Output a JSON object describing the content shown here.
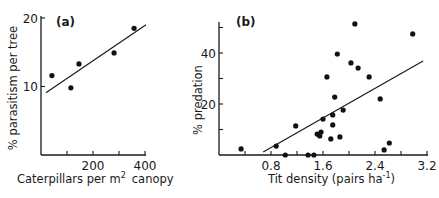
{
  "chart_data": [
    {
      "type": "scatter",
      "panel_label": "(a)",
      "xlabel": "Caterpillars per m",
      "xlabel_superscript": "2",
      "xlabel_suffix": "canopy",
      "ylabel": "% parasitism per tree",
      "xlim": [
        0,
        400
      ],
      "ylim": [
        0,
        20
      ],
      "xticks": [
        100,
        200,
        300,
        400
      ],
      "xtick_labels": [
        {
          "value": 200,
          "label": "200"
        },
        {
          "value": 400,
          "label": "400"
        }
      ],
      "yticks": [
        10,
        20
      ],
      "ytick_labels": [
        {
          "value": 10,
          "label": "10"
        },
        {
          "value": 20,
          "label": "20"
        }
      ],
      "points": [
        {
          "x": 42,
          "y": 11.6
        },
        {
          "x": 115,
          "y": 9.8
        },
        {
          "x": 146,
          "y": 13.3
        },
        {
          "x": 281,
          "y": 14.9
        },
        {
          "x": 358,
          "y": 18.5
        }
      ],
      "fit_line": {
        "x": [
          19,
          404
        ],
        "y": [
          9.1,
          19.0
        ]
      },
      "grid": false
    },
    {
      "type": "scatter",
      "panel_label": "(b)",
      "xlabel": "Tit density (pairs ha",
      "xlabel_superscript": "-1",
      "xlabel_suffix": ")",
      "ylabel": "% predation",
      "xlim": [
        0,
        3.2
      ],
      "ylim": [
        0,
        50
      ],
      "xticks": [
        0.4,
        0.8,
        1.2,
        1.6,
        2.0,
        2.4,
        2.8,
        3.2
      ],
      "xtick_labels": [
        {
          "value": 0.8,
          "label": "0.8"
        },
        {
          "value": 1.6,
          "label": "1.6"
        },
        {
          "value": 2.4,
          "label": "2.4"
        },
        {
          "value": 3.2,
          "label": "3.2"
        }
      ],
      "yticks": [
        10,
        20,
        30,
        40,
        50
      ],
      "ytick_labels": [
        {
          "value": 20,
          "label": "20"
        },
        {
          "value": 40,
          "label": "40"
        }
      ],
      "points": [
        {
          "x": 0.34,
          "y": 2.4
        },
        {
          "x": 0.88,
          "y": 3.5
        },
        {
          "x": 1.02,
          "y": 0
        },
        {
          "x": 1.18,
          "y": 11.4
        },
        {
          "x": 1.37,
          "y": 0
        },
        {
          "x": 1.46,
          "y": 0
        },
        {
          "x": 1.51,
          "y": 8.2
        },
        {
          "x": 1.55,
          "y": 7.5
        },
        {
          "x": 1.57,
          "y": 9.0
        },
        {
          "x": 1.6,
          "y": 14.1
        },
        {
          "x": 1.66,
          "y": 30.6
        },
        {
          "x": 1.72,
          "y": 6.3
        },
        {
          "x": 1.75,
          "y": 15.7
        },
        {
          "x": 1.75,
          "y": 11.8
        },
        {
          "x": 1.78,
          "y": 22.7
        },
        {
          "x": 1.82,
          "y": 39.6
        },
        {
          "x": 1.86,
          "y": 7.1
        },
        {
          "x": 1.91,
          "y": 17.6
        },
        {
          "x": 2.03,
          "y": 36.1
        },
        {
          "x": 2.09,
          "y": 51.4
        },
        {
          "x": 2.14,
          "y": 34.1
        },
        {
          "x": 2.31,
          "y": 30.6
        },
        {
          "x": 2.48,
          "y": 22.0
        },
        {
          "x": 2.54,
          "y": 2.0
        },
        {
          "x": 2.62,
          "y": 4.7
        },
        {
          "x": 2.98,
          "y": 47.5
        }
      ],
      "fit_line": {
        "x": [
          0.68,
          3.14
        ],
        "y": [
          1.2,
          36.9
        ]
      },
      "grid": false
    }
  ]
}
